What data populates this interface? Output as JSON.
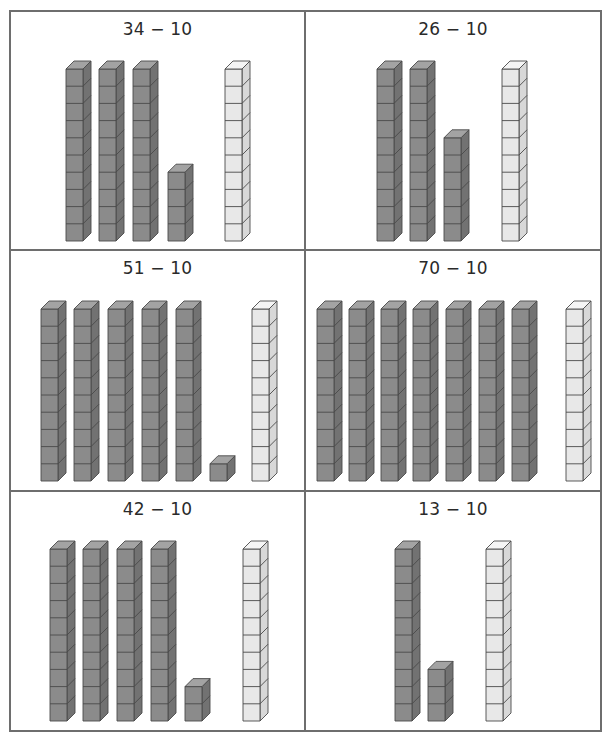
{
  "colors": {
    "border": "#6e6e6e",
    "dark_front": "#8b8b8b",
    "dark_top": "#a3a3a3",
    "dark_side": "#727272",
    "light_front": "#e8e8e8",
    "light_top": "#f5f5f5",
    "light_side": "#d8d8d8",
    "outline": "#4a4a4a"
  },
  "cube": {
    "w": 17,
    "h": 17.2,
    "dx": 8,
    "dy": 8
  },
  "panels": [
    {
      "expression": "34 − 10",
      "minuend": 34,
      "subtrahend": 10,
      "tens": 3,
      "ones": 4,
      "subtract_rods": 1,
      "rods_x": [
        55,
        88,
        122,
        157
      ],
      "light_x": [
        214
      ],
      "bottom_y": 229
    },
    {
      "expression": "26 − 10",
      "minuend": 26,
      "subtrahend": 10,
      "tens": 2,
      "ones": 6,
      "subtract_rods": 1,
      "rods_x": [
        71,
        104,
        138
      ],
      "light_x": [
        196
      ],
      "bottom_y": 229
    },
    {
      "expression": "51 − 10",
      "minuend": 51,
      "subtrahend": 10,
      "tens": 5,
      "ones": 1,
      "subtract_rods": 1,
      "rods_x": [
        30,
        63,
        97,
        131,
        165,
        199
      ],
      "light_x": [
        241
      ],
      "bottom_y": 230
    },
    {
      "expression": "70 − 10",
      "minuend": 70,
      "subtrahend": 10,
      "tens": 7,
      "ones": 0,
      "subtract_rods": 1,
      "rods_x": [
        11,
        43,
        75,
        107,
        140,
        173,
        206
      ],
      "light_x": [
        260
      ],
      "bottom_y": 230
    },
    {
      "expression": "42 − 10",
      "minuend": 42,
      "subtrahend": 10,
      "tens": 4,
      "ones": 2,
      "subtract_rods": 1,
      "rods_x": [
        39,
        72,
        106,
        140,
        174
      ],
      "light_x": [
        232
      ],
      "bottom_y": 229
    },
    {
      "expression": "13 − 10",
      "minuend": 13,
      "subtrahend": 10,
      "tens": 1,
      "ones": 3,
      "subtract_rods": 1,
      "rods_x": [
        89,
        122
      ],
      "light_x": [
        180
      ],
      "bottom_y": 229
    }
  ]
}
